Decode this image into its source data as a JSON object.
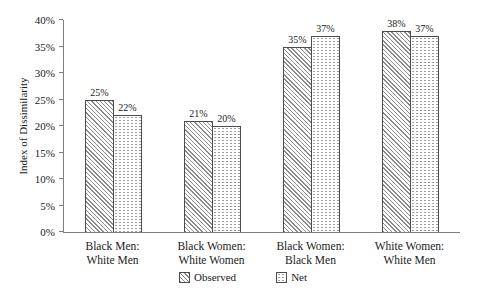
{
  "chart_data": {
    "type": "bar",
    "title": "",
    "xlabel": "",
    "ylabel": "Index of Dissimilarity",
    "ylim": [
      0,
      40
    ],
    "grid": false,
    "legend_position": "bottom-center",
    "yticks": [
      {
        "value": 0,
        "label": "0%"
      },
      {
        "value": 5,
        "label": "5%"
      },
      {
        "value": 10,
        "label": "10%"
      },
      {
        "value": 15,
        "label": "15%"
      },
      {
        "value": 20,
        "label": "20%"
      },
      {
        "value": 25,
        "label": "25%"
      },
      {
        "value": 30,
        "label": "30%"
      },
      {
        "value": 35,
        "label": "35%"
      },
      {
        "value": 40,
        "label": "40%"
      }
    ],
    "categories": [
      {
        "lines": [
          "Black Men:",
          "White Men"
        ]
      },
      {
        "lines": [
          "Black Women:",
          "White Women"
        ]
      },
      {
        "lines": [
          "Black Women:",
          "Black Men"
        ]
      },
      {
        "lines": [
          "White Women:",
          "White Men"
        ]
      }
    ],
    "series": [
      {
        "name": "Observed",
        "pattern": "diagonal-hatch",
        "values": [
          25,
          21,
          35,
          38
        ],
        "labels": [
          "25%",
          "21%",
          "35%",
          "38%"
        ]
      },
      {
        "name": "Net",
        "pattern": "dots",
        "values": [
          22,
          20,
          37,
          37
        ],
        "labels": [
          "22%",
          "20%",
          "37%",
          "37%"
        ]
      }
    ]
  },
  "colors": {
    "background": "#ffffff",
    "axis_line": "#7f7f7f",
    "bar_border": "#4d4d4d",
    "hatch_line": "#8c8c8c",
    "dot_fill": "#9e9e9e",
    "text": "#1a1a1a"
  }
}
